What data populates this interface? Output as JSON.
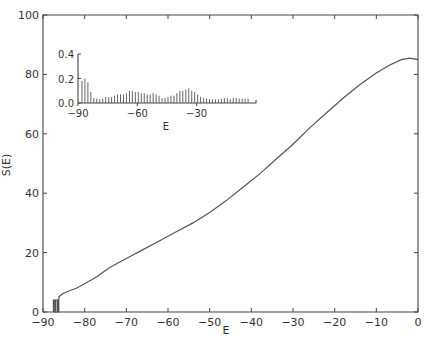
{
  "chart_data": [
    {
      "type": "line",
      "title": "",
      "xlabel": "E",
      "ylabel": "S(E)",
      "xlim": [
        -90,
        0
      ],
      "ylim": [
        0,
        100
      ],
      "xticks": [
        -90,
        -80,
        -70,
        -60,
        -50,
        -40,
        -30,
        -20,
        -10,
        0
      ],
      "yticks": [
        0,
        20,
        40,
        60,
        80,
        100
      ],
      "grid": false,
      "legend": null,
      "series": [
        {
          "name": "S(E)",
          "x": [
            -87.5,
            -87.5,
            -87.2,
            -87.2,
            -86.9,
            -86.9,
            -86.5,
            -86.5,
            -86.2,
            -86.2,
            -85.5,
            -84,
            -82,
            -80,
            -77,
            -74,
            -70,
            -66,
            -62,
            -58,
            -54,
            -50,
            -46,
            -42,
            -38,
            -34,
            -30,
            -26,
            -22,
            -18,
            -14,
            -10,
            -7,
            -4,
            -2,
            0
          ],
          "y": [
            0,
            4,
            4,
            0,
            0,
            4,
            4,
            0,
            0,
            5,
            6,
            7,
            8,
            9.5,
            12,
            15,
            18,
            21,
            24,
            27,
            30,
            33.5,
            37.5,
            42,
            46.5,
            51.5,
            56.5,
            62,
            67,
            72,
            76.5,
            80.5,
            83,
            85,
            85.5,
            85
          ]
        }
      ]
    },
    {
      "type": "bar",
      "title": "",
      "xlabel": "E",
      "ylabel": "",
      "xlim": [
        -90,
        0
      ],
      "ylim": [
        0,
        0.4
      ],
      "xticks": [
        -90,
        -60,
        -30
      ],
      "yticks": [
        0.0,
        0.2,
        0.4
      ],
      "grid": false,
      "x": [
        -88,
        -86.5,
        -85,
        -83.5,
        -82,
        -80.5,
        -79,
        -77.5,
        -76,
        -74.5,
        -73,
        -71.5,
        -70,
        -68.5,
        -67,
        -65.5,
        -64,
        -62.5,
        -61,
        -59.5,
        -58,
        -56.5,
        -55,
        -53.5,
        -52,
        -50.5,
        -49,
        -47.5,
        -46,
        -44.5,
        -43,
        -41.5,
        -40,
        -38.5,
        -37,
        -35.5,
        -34,
        -32.5,
        -31,
        -29.5,
        -28,
        -26.5,
        -25,
        -23.5,
        -22,
        -20.5,
        -19,
        -17.5,
        -16,
        -14.5,
        -13,
        -11.5,
        -10,
        -8.5,
        -7,
        -5.5,
        -4
      ],
      "values": [
        0.18,
        0.2,
        0.17,
        0.09,
        0.04,
        0.035,
        0.03,
        0.035,
        0.05,
        0.045,
        0.05,
        0.06,
        0.07,
        0.07,
        0.07,
        0.08,
        0.1,
        0.1,
        0.09,
        0.09,
        0.08,
        0.08,
        0.07,
        0.07,
        0.08,
        0.07,
        0.06,
        0.04,
        0.04,
        0.05,
        0.06,
        0.06,
        0.08,
        0.1,
        0.1,
        0.11,
        0.12,
        0.1,
        0.09,
        0.07,
        0.05,
        0.04,
        0.035,
        0.03,
        0.03,
        0.03,
        0.03,
        0.035,
        0.04,
        0.04,
        0.03,
        0.04,
        0.04,
        0.035,
        0.035,
        0.035,
        0.035
      ]
    }
  ],
  "main_axis": {
    "ylabel": "S(E)",
    "xlabel": "E",
    "ytick_labels": [
      "0",
      "20",
      "40",
      "60",
      "80",
      "100"
    ],
    "xtick_labels": [
      "-90",
      "-80",
      "-70",
      "-60",
      "-50",
      "-40",
      "-30",
      "-20",
      "-10",
      "0"
    ]
  },
  "inset_axis": {
    "xlabel": "E",
    "ytick_labels": [
      "0.0",
      "0.2",
      "0.4"
    ],
    "xtick_labels": [
      "-90",
      "-60",
      "-30"
    ]
  }
}
